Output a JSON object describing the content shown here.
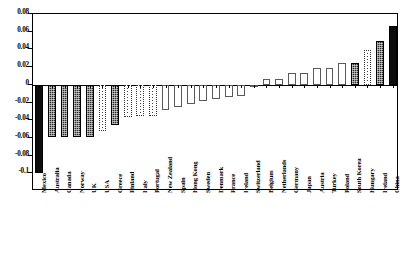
{
  "chart_data": {
    "type": "bar",
    "title": "",
    "subtitle": "",
    "xlabel": "",
    "ylabel": "",
    "ylim": [
      -0.12,
      0.08
    ],
    "yticks": [
      0.08,
      0.06,
      0.04,
      0.02,
      0,
      -0.02,
      -0.04,
      -0.06,
      -0.08,
      -0.1
    ],
    "ytick_labels": [
      "0.08",
      "0.06",
      "0.04",
      "0.02",
      "0",
      "-0.02",
      "-0.04",
      "-0.06",
      "-0.08",
      "-0.1"
    ],
    "grid": false,
    "legend": "none",
    "orientation": "vertical",
    "categories": [
      "Mexico",
      "Australia",
      "Canada",
      "Norway",
      "UK",
      "USA",
      "Greece",
      "Finland",
      "Italy",
      "Portugal",
      "New Zealand",
      "Spain",
      "Hong Kong",
      "Sweden",
      "Denmark",
      "France",
      "Ireland",
      "Switzerland",
      "Belgium",
      "Netherlands",
      "Germany",
      "Japan",
      "Austria",
      "Turkey",
      "Poland",
      "South Korea",
      "Hungary",
      "Ireland",
      "China"
    ],
    "values": [
      -0.1,
      -0.059,
      -0.059,
      -0.059,
      -0.059,
      -0.052,
      -0.045,
      -0.036,
      -0.035,
      -0.035,
      -0.029,
      -0.025,
      -0.022,
      -0.018,
      -0.016,
      -0.014,
      -0.013,
      -0.002,
      0.006,
      0.006,
      0.013,
      0.013,
      0.019,
      0.019,
      0.025,
      0.025,
      0.039,
      0.05,
      0.067
    ],
    "fills": [
      "solid",
      "hatch",
      "hatch",
      "hatch",
      "hatch",
      "dotline",
      "hatch",
      "dotline",
      "dotline",
      "dotline",
      "open",
      "open",
      "open",
      "open",
      "open",
      "open",
      "open",
      "open",
      "open",
      "open",
      "open",
      "open",
      "open",
      "open",
      "open",
      "hatch",
      "dotline",
      "hatch",
      "solid"
    ]
  }
}
